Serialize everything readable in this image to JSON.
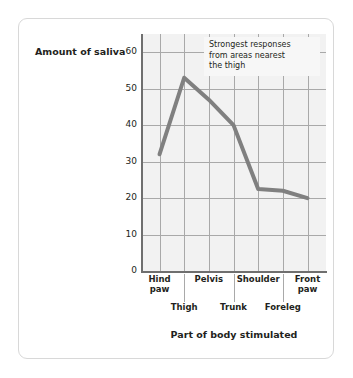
{
  "chart_data": {
    "type": "line",
    "title": "",
    "xlabel": "Part of body stimulated",
    "ylabel": "Amount of saliva",
    "categories": [
      "Hind paw",
      "Thigh",
      "Pelvis",
      "Trunk",
      "Shoulder",
      "Foreleg",
      "Front paw"
    ],
    "values": [
      32,
      53,
      47,
      40,
      22.5,
      22,
      20
    ],
    "ylim": [
      0,
      65
    ],
    "yticks": [
      0,
      10,
      20,
      30,
      40,
      50,
      60
    ],
    "ytick_labels": [
      "0",
      "10",
      "20",
      "30",
      "40",
      "50",
      "60"
    ],
    "grid": true,
    "legend": "none",
    "series_color": "#808080",
    "plot_background": "#f2f2f2",
    "grid_color": "#a9a9a9",
    "annotations": [
      {
        "lines": [
          "Strongest responses",
          "from areas nearest",
          "the thigh"
        ],
        "background": "#f7f7f7"
      }
    ]
  },
  "axis": {
    "y_title": "Amount of saliva",
    "x_title": "Part of body stimulated",
    "y_ticks": [
      "60",
      "50",
      "40",
      "30",
      "20",
      "10",
      "0"
    ],
    "x_labels_upper": [
      {
        "line1": "Hind",
        "line2": "paw"
      },
      {
        "line1": "Pelvis",
        "line2": ""
      },
      {
        "line1": "Shoulder",
        "line2": ""
      },
      {
        "line1": "Front",
        "line2": "paw"
      }
    ],
    "x_labels_lower": [
      "Thigh",
      "Trunk",
      "Foreleg"
    ]
  },
  "annotation": {
    "line1": "Strongest responses",
    "line2": "from areas nearest",
    "line3": "the thigh"
  }
}
